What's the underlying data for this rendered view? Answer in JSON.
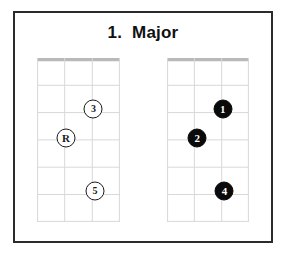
{
  "page": {
    "background_color": "#ffffff",
    "border_color": "#2b2b2b"
  },
  "header": {
    "title": "1.  Major"
  },
  "diagrams": [
    {
      "name": "left-chord-diagram",
      "style": "outline",
      "strings": 3,
      "frets": 6,
      "nut": true,
      "markers": [
        {
          "label": "3",
          "string": 3,
          "fret": 2,
          "x_pct": 68,
          "y_pct": 31
        },
        {
          "label": "R",
          "string": 1,
          "fret": 3,
          "x_pct": 35,
          "y_pct": 49
        },
        {
          "label": "5",
          "string": 3,
          "fret": 5,
          "x_pct": 70,
          "y_pct": 81
        }
      ]
    },
    {
      "name": "right-chord-diagram",
      "style": "filled",
      "strings": 3,
      "frets": 6,
      "nut": true,
      "markers": [
        {
          "label": "1",
          "string": 3,
          "fret": 2,
          "x_pct": 68,
          "y_pct": 31
        },
        {
          "label": "2",
          "string": 1,
          "fret": 3,
          "x_pct": 37,
          "y_pct": 49
        },
        {
          "label": "4",
          "string": 3,
          "fret": 5,
          "x_pct": 70,
          "y_pct": 81
        }
      ]
    }
  ],
  "colors": {
    "grid_line": "#d8d8d8",
    "nut_line": "#b9b9b9",
    "marker_outline": "#1a1a1a",
    "marker_fill": "#0a0a0a",
    "text": "#111111"
  }
}
